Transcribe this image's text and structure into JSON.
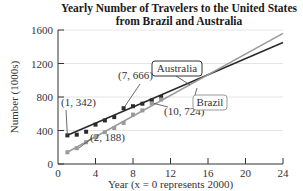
{
  "chart_data": {
    "type": "scatter",
    "title": "Yearly Number of Travelers to the United States from Brazil and Australia",
    "title_lines": [
      "Yearly Number of Travelers to the United States",
      "from Brazil and Australia"
    ],
    "xlabel": "Year (x = 0 represents 2000)",
    "ylabel": "Number (1000s)",
    "xlim": [
      0,
      24
    ],
    "ylim": [
      0,
      1600
    ],
    "xticks": [
      0,
      4,
      8,
      12,
      16,
      20,
      24
    ],
    "yticks": [
      0,
      400,
      800,
      1200,
      1600
    ],
    "grid": true,
    "series": [
      {
        "name": "Australia",
        "color": "#2b2b2b",
        "x": [
          1,
          2,
          3,
          4,
          5,
          6,
          7,
          8,
          9,
          10,
          11
        ],
        "values": [
          342,
          350,
          385,
          470,
          520,
          560,
          666,
          690,
          720,
          760,
          800
        ],
        "trendline": {
          "from": [
            1,
            342
          ],
          "to": [
            24,
            1450
          ]
        }
      },
      {
        "name": "Brazil",
        "color": "#9a9a9a",
        "x": [
          1,
          2,
          3,
          4,
          5,
          6,
          7,
          8,
          9,
          10,
          11
        ],
        "values": [
          140,
          188,
          260,
          320,
          380,
          430,
          490,
          590,
          640,
          724,
          770
        ],
        "trendline": {
          "from": [
            1,
            140
          ],
          "to": [
            24,
            1560
          ]
        }
      }
    ],
    "annotations": [
      {
        "text": "(1, 342)",
        "point": [
          1,
          342
        ]
      },
      {
        "text": "(7, 666)",
        "point": [
          7,
          666
        ]
      },
      {
        "text": "(2, 188)",
        "point": [
          2,
          188
        ]
      },
      {
        "text": "(10, 724)",
        "point": [
          10,
          724
        ]
      }
    ],
    "legend_labels": [
      {
        "text": "Australia",
        "boxed": true
      },
      {
        "text": "Brazil",
        "boxed": true
      }
    ]
  }
}
